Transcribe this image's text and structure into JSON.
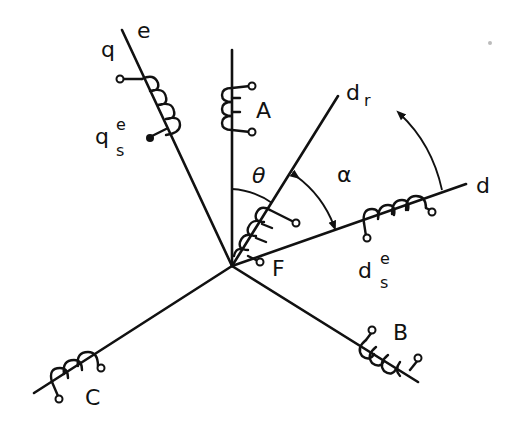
{
  "diagram": {
    "origin": [
      232,
      266
    ],
    "axes": [
      {
        "id": "A",
        "label": "A",
        "angle_deg": 90
      },
      {
        "id": "B",
        "label": "B",
        "angle_deg": -30
      },
      {
        "id": "C",
        "label": "C",
        "angle_deg": 210
      },
      {
        "id": "d",
        "label": "d",
        "angle_deg": 15
      },
      {
        "id": "q",
        "label": "q",
        "angle_deg": 105
      },
      {
        "id": "dr",
        "label": "d",
        "subscript": "r",
        "angle_deg": 52
      }
    ],
    "labels": {
      "q_axis": "q",
      "e_axis": "e",
      "qs_e_base": "q",
      "qs_e_sub": "s",
      "qs_e_sup": "e",
      "phase_A": "A",
      "phase_B": "B",
      "phase_C": "C",
      "dr_base": "d",
      "dr_sub": "r",
      "d_axis": "d",
      "ds_e_base": "d",
      "ds_e_sub": "s",
      "ds_e_sup": "e",
      "field": "F",
      "theta": "θ",
      "alpha": "α"
    },
    "angles": [
      {
        "symbol": "θ",
        "from": "A",
        "to": "dr"
      },
      {
        "symbol": "α",
        "from": "dr",
        "to": "d",
        "arrows": "both"
      }
    ],
    "rotation_arrow": {
      "direction": "counter-clockwise",
      "near": "d"
    }
  }
}
